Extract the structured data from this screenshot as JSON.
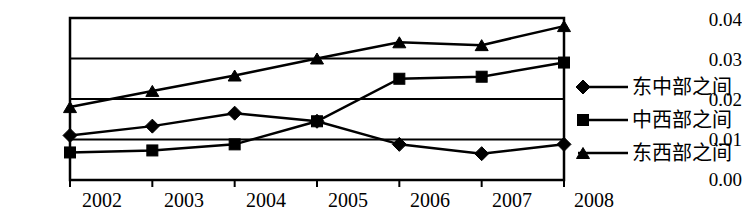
{
  "chart_data": {
    "type": "line",
    "title": "",
    "xlabel": "",
    "ylabel": "",
    "categories": [
      "2002",
      "2003",
      "2004",
      "2005",
      "2006",
      "2007",
      "2008"
    ],
    "ylim": [
      0.0,
      0.04
    ],
    "ytick_labels": [
      "0.04",
      "0.03",
      "0.02",
      "0.01",
      "0.00"
    ],
    "ytick_values": [
      0.04,
      0.03,
      0.02,
      0.01,
      0.0
    ],
    "grid": true,
    "legend_position": "right",
    "series": [
      {
        "name": "东中部之间",
        "marker": "diamond",
        "values": [
          0.011,
          0.0133,
          0.0165,
          0.0145,
          0.0088,
          0.0065,
          0.0088
        ]
      },
      {
        "name": "中西部之间",
        "marker": "square",
        "values": [
          0.0068,
          0.0073,
          0.0088,
          0.0145,
          0.025,
          0.0255,
          0.029
        ]
      },
      {
        "name": "东西部之间",
        "marker": "triangle",
        "values": [
          0.018,
          0.022,
          0.0258,
          0.03,
          0.034,
          0.0333,
          0.038
        ]
      }
    ],
    "colors": {
      "series_line": "#000000",
      "axis": "#000000",
      "grid": "#000000",
      "background": "#ffffff"
    }
  }
}
